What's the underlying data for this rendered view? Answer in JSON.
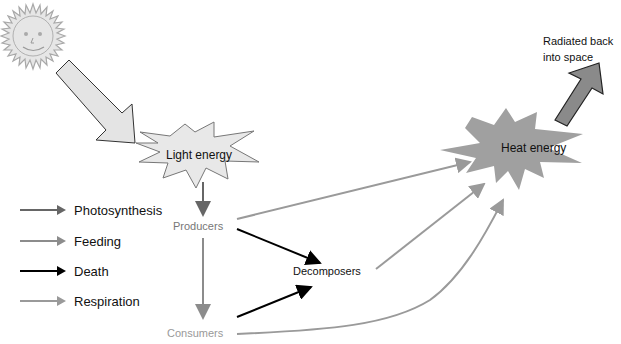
{
  "diagram": {
    "title_clipped": "Energy flow in an ecosystem",
    "nodes": {
      "sun": {
        "icon": "sun-icon"
      },
      "light_energy": "Light energy",
      "heat_energy": "Heat energy",
      "radiated": "Radiated back into space",
      "radiated_line1": "Radiated back",
      "radiated_line2": "into space",
      "producers": "Producers",
      "consumers": "Consumers",
      "decomposers": "Decomposers"
    },
    "legend": [
      {
        "label": "Photosynthesis",
        "color": "#666666"
      },
      {
        "label": "Feeding",
        "color": "#8c8c8c"
      },
      {
        "label": "Death",
        "color": "#000000"
      },
      {
        "label": "Respiration",
        "color": "#9a9a9a"
      }
    ],
    "colors": {
      "sun_fill": "#e6e6e6",
      "sun_stroke": "#a8a8a8",
      "light_star_fill": "#e8e8e8",
      "heat_star_fill": "#a0a0a0",
      "radiated_arrow_fill": "#8a8a8a",
      "sunlight_arrow_fill": "#e4e4e4"
    }
  }
}
